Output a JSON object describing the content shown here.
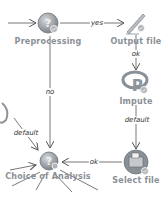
{
  "diagram": {
    "nodes": [
      {
        "id": "preprocessing",
        "label": "Preprocessing",
        "icon": "question-icon",
        "x": 48,
        "y": 23
      },
      {
        "id": "output_file",
        "label": "Output file",
        "icon": "pen-icon",
        "x": 136,
        "y": 23
      },
      {
        "id": "impute",
        "label": "Impute",
        "icon": "r-logo-icon",
        "x": 136,
        "y": 84
      },
      {
        "id": "select_file",
        "label": "Select file",
        "icon": "folder-icon",
        "x": 136,
        "y": 162
      },
      {
        "id": "choice_of_analysis",
        "label": "Choice of Analysis",
        "icon": "question-icon",
        "x": 48,
        "y": 162
      }
    ],
    "edges": [
      {
        "from": "preprocessing",
        "to": "output_file",
        "label": "yes"
      },
      {
        "from": "output_file",
        "to": "impute",
        "label": "ok"
      },
      {
        "from": "impute",
        "to": "select_file",
        "label": "default"
      },
      {
        "from": "select_file",
        "to": "choice_of_analysis",
        "label": "ok"
      },
      {
        "from": "preprocessing",
        "to": "choice_of_analysis",
        "label": "no"
      },
      {
        "from": "offscreen",
        "to": "choice_of_analysis",
        "label": "default"
      }
    ],
    "colors": {
      "node_label": "#8a8f96",
      "edge": "#555555",
      "icon_base": "#8f959c",
      "check_badge": "#b0b4b8"
    }
  }
}
